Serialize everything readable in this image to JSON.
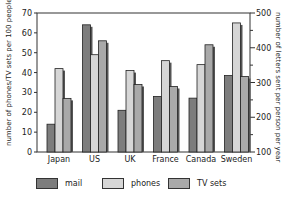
{
  "chart_data": {
    "type": "bar",
    "title": "",
    "categories": [
      "Japan",
      "US",
      "UK",
      "France",
      "Canada",
      "Sweden"
    ],
    "series": [
      {
        "name": "mail",
        "axis": "right",
        "color": "#7d7d7d",
        "values": [
          180,
          466,
          220,
          260,
          255,
          320
        ]
      },
      {
        "name": "phones",
        "axis": "left",
        "color": "#d6d6d6",
        "values": [
          42,
          49,
          41,
          46,
          44,
          65
        ]
      },
      {
        "name": "TV sets",
        "axis": "left",
        "color": "#a9a9a9",
        "values": [
          27,
          56,
          34,
          33,
          54,
          38
        ]
      }
    ],
    "ylabel": "number of phones/TV sets per 100 people",
    "ylabel_right": "number of letters sent per person per year",
    "ylim": [
      0,
      70
    ],
    "ylim_right": [
      100,
      500
    ],
    "yticks": [
      0,
      10,
      20,
      30,
      40,
      50,
      60,
      70
    ],
    "yticks_right": [
      100,
      200,
      300,
      400,
      500
    ],
    "grid": false,
    "legend_position": "bottom"
  },
  "legend": [
    {
      "label": "mail",
      "color": "#7d7d7d"
    },
    {
      "label": "phones",
      "color": "#d6d6d6"
    },
    {
      "label": "TV sets",
      "color": "#a9a9a9"
    }
  ],
  "axis": {
    "left_label": "number of phones/TV sets per 100 people",
    "right_label": "number of letters sent per person per year"
  }
}
